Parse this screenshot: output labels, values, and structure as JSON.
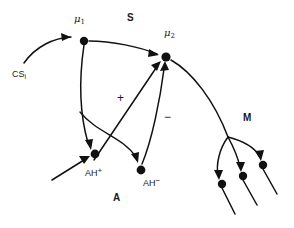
{
  "figure": {
    "title": "",
    "type": "neural-circuit-diagram",
    "background_color": "#ffffff",
    "stroke_color": "#111111",
    "width": 294,
    "height": 228
  },
  "regions": [
    {
      "id": "S",
      "label": "S",
      "x": 127,
      "y": 13
    },
    {
      "id": "M",
      "label": "M",
      "x": 243,
      "y": 113
    },
    {
      "id": "A",
      "label": "A",
      "x": 113,
      "y": 193
    }
  ],
  "nodes": [
    {
      "id": "mu1",
      "label_base": "μ",
      "label_sub": "1",
      "label_sup": "",
      "label_text": "μ₁",
      "label_x": 74,
      "label_y": 14,
      "cx": 84,
      "cy": 41,
      "r": 4.2
    },
    {
      "id": "mu2",
      "label_base": "μ",
      "label_sub": "2",
      "label_sup": "",
      "label_text": "μ₂",
      "label_x": 164,
      "label_y": 28,
      "cx": 166,
      "cy": 57,
      "r": 4.6
    },
    {
      "id": "ahplus",
      "label_base": "AH",
      "label_sub": "",
      "label_sup": "+",
      "label_text": "AH⁺",
      "label_x": 85,
      "label_y": 167,
      "cx": 95,
      "cy": 154,
      "r": 4.4
    },
    {
      "id": "ahminus",
      "label_base": "AH",
      "label_sub": "",
      "label_sup": "−",
      "label_text": "AH⁻",
      "label_x": 143,
      "label_y": 177,
      "cx": 141,
      "cy": 170,
      "r": 4.4
    },
    {
      "id": "m1",
      "label_text": "",
      "cx": 222,
      "cy": 184,
      "r": 4.2
    },
    {
      "id": "m2",
      "label_text": "",
      "cx": 243,
      "cy": 176,
      "r": 4.2
    },
    {
      "id": "m3",
      "label_text": "",
      "cx": 263,
      "cy": 165,
      "r": 4.2
    }
  ],
  "input_labels": [
    {
      "id": "cs-input",
      "label_base": "CS",
      "label_sub": "i",
      "label_text": "CSᵢ",
      "x": 12,
      "y": 70
    }
  ],
  "sign_labels": [
    {
      "id": "plus-sign",
      "label": "+",
      "x": 117,
      "y": 92
    },
    {
      "id": "minus-sign",
      "label": "−",
      "x": 164,
      "y": 111
    }
  ],
  "edges": [
    {
      "id": "cs-to-mu1",
      "from": "CS_i",
      "to": "mu1",
      "sign": ""
    },
    {
      "id": "mu1-to-mu2",
      "from": "mu1",
      "to": "mu2",
      "sign": ""
    },
    {
      "id": "mu1-to-ahplus",
      "from": "mu1",
      "to": "ahplus",
      "sign": ""
    },
    {
      "id": "mu1-to-ahminus",
      "from": "mu1",
      "to": "ahminus",
      "sign": ""
    },
    {
      "id": "ahplus-to-mu2",
      "from": "ahplus",
      "to": "mu2",
      "sign": "+"
    },
    {
      "id": "ahminus-to-mu2",
      "from": "ahminus",
      "to": "mu2",
      "sign": "−"
    },
    {
      "id": "ext-to-ahplus",
      "from": "external",
      "to": "ahplus",
      "sign": ""
    },
    {
      "id": "mu2-to-m-junction",
      "from": "mu2",
      "to": "m-junction",
      "sign": ""
    },
    {
      "id": "m-junction-to-m1",
      "from": "m-junction",
      "to": "m1",
      "sign": ""
    },
    {
      "id": "m-junction-to-m2",
      "from": "m-junction",
      "to": "m2",
      "sign": ""
    },
    {
      "id": "m-junction-to-m3",
      "from": "m-junction",
      "to": "m3",
      "sign": ""
    },
    {
      "id": "m1-tail",
      "from": "m1",
      "to": "output",
      "sign": ""
    },
    {
      "id": "m2-tail",
      "from": "m2",
      "to": "output",
      "sign": ""
    },
    {
      "id": "m3-tail",
      "from": "m3",
      "to": "output",
      "sign": ""
    }
  ]
}
